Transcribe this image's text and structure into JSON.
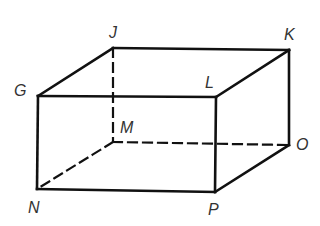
{
  "diagram": {
    "type": "rectangular-prism",
    "vertices": {
      "G": {
        "label": "G",
        "x": 38,
        "y": 96,
        "lx": 14,
        "ly": 96
      },
      "J": {
        "label": "J",
        "x": 113,
        "y": 48,
        "lx": 109,
        "ly": 38
      },
      "K": {
        "label": "K",
        "x": 289,
        "y": 50,
        "lx": 284,
        "ly": 40
      },
      "L": {
        "label": "L",
        "x": 216,
        "y": 97,
        "lx": 205,
        "ly": 88
      },
      "M": {
        "label": "M",
        "x": 113,
        "y": 142,
        "lx": 120,
        "ly": 133
      },
      "N": {
        "label": "N",
        "x": 37,
        "y": 189,
        "lx": 28,
        "ly": 213
      },
      "O": {
        "label": "O",
        "x": 289,
        "y": 145,
        "lx": 296,
        "ly": 150
      },
      "P": {
        "label": "P",
        "x": 215,
        "y": 192,
        "lx": 208,
        "ly": 215
      }
    },
    "solid_edges": [
      [
        "G",
        "J"
      ],
      [
        "J",
        "K"
      ],
      [
        "G",
        "L"
      ],
      [
        "L",
        "K"
      ],
      [
        "G",
        "N"
      ],
      [
        "L",
        "P"
      ],
      [
        "K",
        "O"
      ],
      [
        "N",
        "P"
      ],
      [
        "P",
        "O"
      ]
    ],
    "hidden_edges": [
      [
        "J",
        "M"
      ],
      [
        "M",
        "N"
      ],
      [
        "M",
        "O"
      ]
    ],
    "line_color": "#111111"
  }
}
